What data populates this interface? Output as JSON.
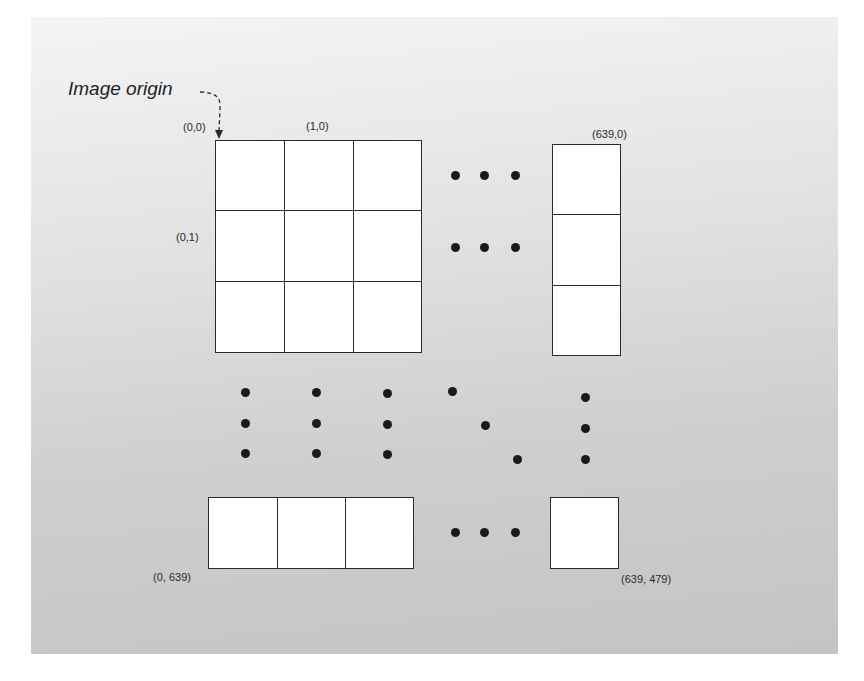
{
  "diagram": {
    "title": "Image origin",
    "colors": {
      "grid_line": "#2a2a2a",
      "cell_fill": "#ffffff",
      "dot": "#1a1a1a",
      "panel_top": "#f4f4f4",
      "panel_bottom": "#c4c4c4"
    },
    "labels": {
      "top_left": "(0,0)",
      "top_second": "(1,0)",
      "second_row_left": "(0,1)",
      "top_right": "(639,0)",
      "bottom_left": "(0, 639)",
      "bottom_right": "(639, 479)"
    },
    "top_grid": {
      "rows": 3,
      "cols": 3
    },
    "right_column": {
      "rows": 3,
      "cols": 1
    },
    "bottom_row": {
      "rows": 1,
      "cols": 3
    },
    "bottom_right_cell": {
      "rows": 1,
      "cols": 1
    },
    "ellipsis_icons": [
      "horizontal-ellipsis-icon",
      "vertical-ellipsis-icon",
      "diagonal-ellipsis-icon"
    ]
  }
}
